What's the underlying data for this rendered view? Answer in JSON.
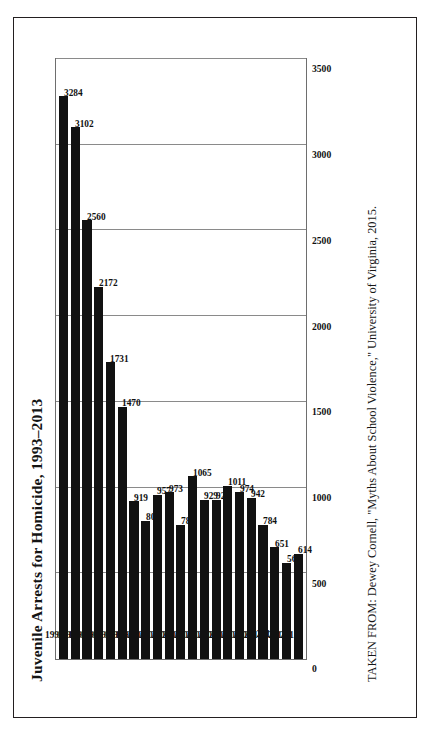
{
  "figure": {
    "title": "Juvenile Arrests for Homicide, 1993–2013",
    "caption": "TAKEN FROM: Dewey Cornell, \"Myths About School Violence,\" University of Virginia, 2015."
  },
  "chart_data": {
    "type": "bar",
    "orientation": "horizontal",
    "title": "Juvenile Arrests for Homicide, 1993–2013",
    "xlabel": "",
    "ylabel": "",
    "categories": [
      "1993",
      "1994",
      "1995",
      "1996",
      "1997",
      "1998",
      "1999",
      "2000",
      "2001",
      "2002",
      "2003",
      "2004",
      "2005",
      "2006",
      "2007",
      "2008",
      "2009",
      "2010",
      "2011",
      "2012",
      "2013"
    ],
    "values": [
      3284,
      3102,
      2560,
      2172,
      1731,
      1470,
      919,
      806,
      957,
      973,
      783,
      1065,
      929,
      929,
      1011,
      974,
      942,
      784,
      651,
      560,
      614
    ],
    "value_ticks": [
      "3500",
      "3000",
      "2500",
      "2000",
      "1500",
      "1000",
      "500",
      "0"
    ],
    "value_tick_numbers": [
      3500,
      3000,
      2500,
      2000,
      1500,
      1000,
      500,
      0
    ],
    "xlim": [
      0,
      3500
    ],
    "grid": true,
    "grid_axis": "value",
    "legend": "none",
    "data_labels": true,
    "bar_color": "#111111",
    "frame_color": "#6e6e6e"
  }
}
